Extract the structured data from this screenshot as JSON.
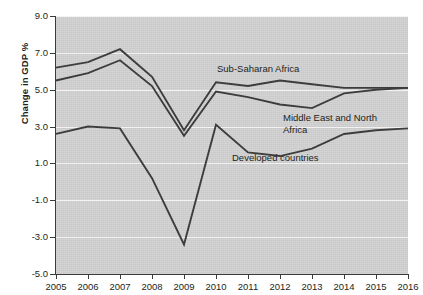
{
  "chart_data": {
    "type": "line",
    "title": "",
    "xlabel": "",
    "ylabel": "Change in GDP %",
    "x": [
      2005,
      2006,
      2007,
      2008,
      2009,
      2010,
      2011,
      2012,
      2013,
      2014,
      2015,
      2016
    ],
    "xtick_labels": [
      "2005",
      "2006",
      "2007",
      "2008",
      "2009",
      "2010",
      "2011",
      "2012",
      "2013",
      "2014",
      "2015",
      "2016"
    ],
    "ytick_labels": [
      "9.0",
      "7.0",
      "5.0",
      "3.0",
      "1.0",
      "-1.0",
      "-3.0",
      "-5.0"
    ],
    "ytick_values": [
      9.0,
      7.0,
      5.0,
      3.0,
      1.0,
      -1.0,
      -3.0,
      -5.0
    ],
    "ylim": [
      -5.0,
      9.0
    ],
    "xlim": [
      2005,
      2016
    ],
    "grid": true,
    "legend_position": "inline-annotations",
    "plot_background": "#d2d2d2",
    "line_color": "#3d3d3d",
    "series": [
      {
        "name": "Sub-Saharan Africa",
        "values": [
          6.2,
          6.5,
          7.2,
          5.7,
          2.8,
          5.4,
          5.2,
          5.5,
          5.3,
          5.1,
          5.1,
          5.1
        ]
      },
      {
        "name": "Middle East and North Africa",
        "values": [
          5.5,
          5.9,
          6.6,
          5.2,
          2.5,
          4.9,
          4.6,
          4.2,
          4.0,
          4.8,
          5.0,
          5.1
        ]
      },
      {
        "name": "Developed countries",
        "values": [
          2.6,
          3.0,
          2.9,
          0.2,
          -3.4,
          3.1,
          1.6,
          1.4,
          1.8,
          2.6,
          2.8,
          2.9
        ]
      }
    ],
    "annotations": [
      {
        "text": "Sub-Saharan Africa",
        "x_px": 217,
        "y_px": 63
      },
      {
        "text": "Middle East and North",
        "x_px": 283,
        "y_px": 112
      },
      {
        "text": "Africa",
        "x_px": 283,
        "y_px": 124
      },
      {
        "text": "Developed countries",
        "x_px": 232,
        "y_px": 152
      }
    ]
  }
}
